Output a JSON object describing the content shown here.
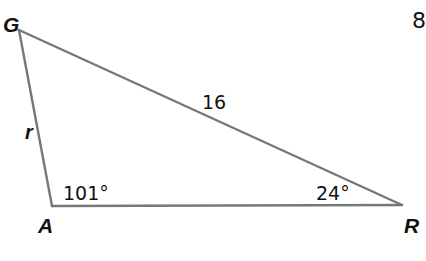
{
  "diagram": {
    "type": "triangle",
    "line_color": "#777777",
    "vertices": {
      "G": {
        "label": "G",
        "x": 19,
        "y": 30
      },
      "A": {
        "label": "A",
        "x": 52,
        "y": 206
      },
      "R": {
        "label": "R",
        "x": 402,
        "y": 205
      }
    },
    "sides": {
      "GR": {
        "label": "16"
      },
      "GA": {
        "label": "r"
      }
    },
    "angles": {
      "A": {
        "label": "101°"
      },
      "R": {
        "label": "24°"
      }
    },
    "problem_number": "8"
  }
}
